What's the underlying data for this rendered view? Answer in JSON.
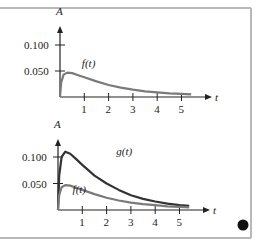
{
  "frame": {
    "border_color": "#b8b8b8",
    "marker_color": "#111111"
  },
  "chart_data": [
    {
      "type": "line",
      "title": "",
      "xlabel": "t",
      "ylabel": "A",
      "xlim": [
        0,
        5.6
      ],
      "ylim": [
        0,
        0.13
      ],
      "grid": false,
      "x_ticks": [
        "1",
        "2",
        "3",
        "4",
        "5"
      ],
      "y_ticks": [
        "0.050",
        "0.100"
      ],
      "x": [
        0,
        0.05,
        0.15,
        0.3,
        0.5,
        0.75,
        1,
        1.5,
        2,
        2.5,
        3,
        3.5,
        4,
        4.5,
        5,
        5.4
      ],
      "series": [
        {
          "name": "f(t)",
          "color": "#7a7a7a",
          "values": [
            0,
            0.028,
            0.043,
            0.047,
            0.046,
            0.042,
            0.038,
            0.03,
            0.023,
            0.018,
            0.014,
            0.011,
            0.009,
            0.007,
            0.006,
            0.005
          ]
        }
      ],
      "annotations": [
        {
          "text": "f(t)",
          "x": 0.9,
          "y": 0.058
        }
      ]
    },
    {
      "type": "line",
      "title": "",
      "xlabel": "t",
      "ylabel": "A",
      "xlim": [
        0,
        5.6
      ],
      "ylim": [
        0,
        0.13
      ],
      "grid": false,
      "x_ticks": [
        "1",
        "2",
        "3",
        "4",
        "5"
      ],
      "y_ticks": [
        "0.050",
        "0.100"
      ],
      "x": [
        0,
        0.05,
        0.15,
        0.3,
        0.5,
        0.75,
        1,
        1.5,
        2,
        2.5,
        3,
        3.5,
        4,
        4.5,
        5,
        5.4
      ],
      "series": [
        {
          "name": "g(t)",
          "color": "#333333",
          "values": [
            0,
            0.065,
            0.1,
            0.11,
            0.106,
            0.096,
            0.085,
            0.065,
            0.05,
            0.038,
            0.028,
            0.021,
            0.016,
            0.012,
            0.009,
            0.008
          ]
        },
        {
          "name": "f(t)",
          "color": "#7a7a7a",
          "values": [
            0,
            0.028,
            0.043,
            0.047,
            0.046,
            0.042,
            0.038,
            0.03,
            0.023,
            0.018,
            0.014,
            0.011,
            0.009,
            0.007,
            0.006,
            0.005
          ]
        }
      ],
      "annotations": [
        {
          "text": "g(t)",
          "x": 2.4,
          "y": 0.103
        },
        {
          "text": "f(t)",
          "x": 0.6,
          "y": 0.032
        }
      ]
    }
  ]
}
